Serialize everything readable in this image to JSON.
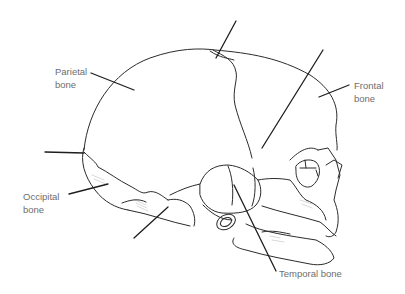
{
  "diagram": {
    "labels": {
      "parietal": {
        "line1": "Parietal",
        "line2": "bone"
      },
      "frontal": {
        "line1": "Frontal",
        "line2": "bone"
      },
      "occipital": {
        "line1": "Occipital",
        "line2": "bone"
      },
      "temporal": {
        "line1": "Temporal bone"
      }
    },
    "unlabeled_leader_lines": 4,
    "colors": {
      "stroke": "#2b2b2b",
      "label_text": "#6e6e6e",
      "background": "#ffffff"
    }
  }
}
